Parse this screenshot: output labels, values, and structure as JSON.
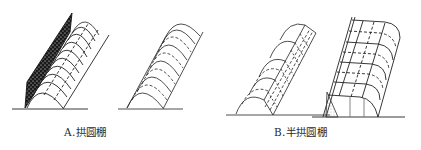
{
  "figure": {
    "stroke_color": "#222222",
    "background": "#ffffff"
  },
  "captions": {
    "a": "A.拱圆棚",
    "b": "B.半拱圆棚"
  },
  "panels": [
    {
      "id": "a1",
      "group": "A",
      "type": "full-arch shed with dark cover sheet"
    },
    {
      "id": "a2",
      "group": "A",
      "type": "full-arch shed frame"
    },
    {
      "id": "b1",
      "group": "B",
      "type": "half-arch shed with grid side wall"
    },
    {
      "id": "b2",
      "group": "B",
      "type": "half-arch shed with back wall"
    }
  ]
}
